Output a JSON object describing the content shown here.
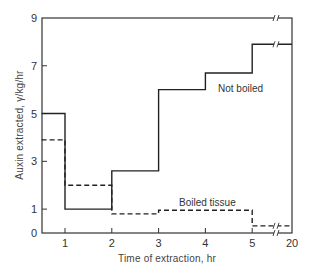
{
  "chart_data": {
    "type": "line",
    "subtype": "step",
    "title": "",
    "xlabel": "Time of extraction, hr",
    "ylabel": "Auxin extracted, γ/kg/hr",
    "xlim": [
      0.5,
      20
    ],
    "ylim": [
      0,
      9
    ],
    "x_ticks": [
      "1",
      "2",
      "3",
      "4",
      "5",
      "20"
    ],
    "y_ticks": [
      "0",
      "1",
      "3",
      "5",
      "7",
      "9"
    ],
    "x_axis_break": "between 5 and 20",
    "grid": false,
    "legend": "inline labels",
    "series": [
      {
        "name": "Not boiled",
        "style": "solid",
        "steps": [
          {
            "x_start": 0.5,
            "x_end": 1,
            "value": 5.0
          },
          {
            "x_start": 1,
            "x_end": 2,
            "value": 1.0
          },
          {
            "x_start": 2,
            "x_end": 3,
            "value": 2.6
          },
          {
            "x_start": 3,
            "x_end": 4,
            "value": 6.0
          },
          {
            "x_start": 4,
            "x_end": 5,
            "value": 6.7
          },
          {
            "x_start": 5,
            "x_end": 20,
            "value": 7.9
          }
        ]
      },
      {
        "name": "Boiled tissue",
        "style": "dashed",
        "steps": [
          {
            "x_start": 0.5,
            "x_end": 1,
            "value": 3.9
          },
          {
            "x_start": 1,
            "x_end": 2,
            "value": 2.0
          },
          {
            "x_start": 2,
            "x_end": 3,
            "value": 0.8
          },
          {
            "x_start": 3,
            "x_end": 5,
            "value": 0.95
          },
          {
            "x_start": 5,
            "x_end": 20,
            "value": 0.3
          }
        ]
      }
    ]
  },
  "labels": {
    "xlabel": "Time of extraction, hr",
    "ylabel": "Auxin extracted, γ/kg/hr",
    "series_not_boiled": "Not boiled",
    "series_boiled": "Boiled tissue"
  }
}
